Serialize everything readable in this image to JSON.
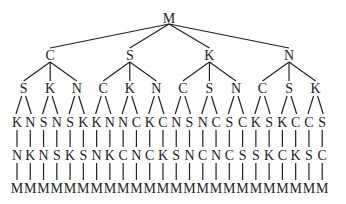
{
  "diagram": {
    "type": "permutation-tree",
    "root": "M",
    "level1": [
      "C",
      "S",
      "K",
      "N"
    ],
    "level2": [
      [
        "S",
        "K",
        "N"
      ],
      [
        "C",
        "K",
        "N"
      ],
      [
        "C",
        "S",
        "N"
      ],
      [
        "C",
        "S",
        "K"
      ]
    ],
    "level3": [
      "K",
      "N",
      "S",
      "N",
      "S",
      "K",
      "K",
      "N",
      "N",
      "C",
      "K",
      "C",
      "N",
      "S",
      "N",
      "C",
      "S",
      "C",
      "K",
      "S",
      "K",
      "C",
      "C",
      "S"
    ],
    "level4": [
      "N",
      "K",
      "N",
      "S",
      "K",
      "S",
      "N",
      "K",
      "C",
      "N",
      "C",
      "K",
      "S",
      "N",
      "C",
      "N",
      "C",
      "S",
      "S",
      "K",
      "C",
      "K",
      "S",
      "C"
    ],
    "level5": [
      "M",
      "M",
      "M",
      "M",
      "M",
      "M",
      "M",
      "M",
      "M",
      "M",
      "M",
      "M",
      "M",
      "M",
      "M",
      "M",
      "M",
      "M",
      "M",
      "M",
      "M",
      "M",
      "M",
      "M"
    ]
  }
}
